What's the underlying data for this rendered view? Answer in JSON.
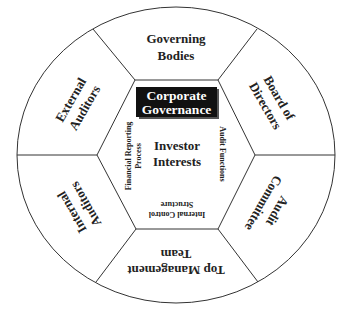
{
  "diagram": {
    "title": {
      "line1": "Corporate",
      "line2": "Governance"
    },
    "center": {
      "line1": "Investor",
      "line2": "Interests"
    },
    "outer_segments": [
      {
        "id": "governing-bodies",
        "line1": "Governing",
        "line2": "Bodies",
        "position": "top"
      },
      {
        "id": "board-of-directors",
        "line1": "Board of",
        "line2": "Directors",
        "position": "top-right"
      },
      {
        "id": "audit-committee",
        "line1": "Audit",
        "line2": "Committee",
        "position": "bottom-right"
      },
      {
        "id": "top-management-team",
        "line1": "Top Management",
        "line2": "Team",
        "position": "bottom"
      },
      {
        "id": "internal-auditors",
        "line1": "Internal",
        "line2": "Auditors",
        "position": "bottom-left"
      },
      {
        "id": "external-auditors",
        "line1": "External",
        "line2": "Auditors",
        "position": "top-left"
      }
    ],
    "inner_labels": {
      "left": {
        "line1": "Financial  Reporting",
        "line2": "Process"
      },
      "right": {
        "line1": "Audit Functions"
      },
      "bottom": {
        "line1": "Internal  Control",
        "line2": "Structure"
      }
    },
    "colors": {
      "line": "#333333",
      "title_box": "#111111",
      "title_text": "#ffffff",
      "text": "#222222",
      "background": "#ffffff"
    }
  }
}
